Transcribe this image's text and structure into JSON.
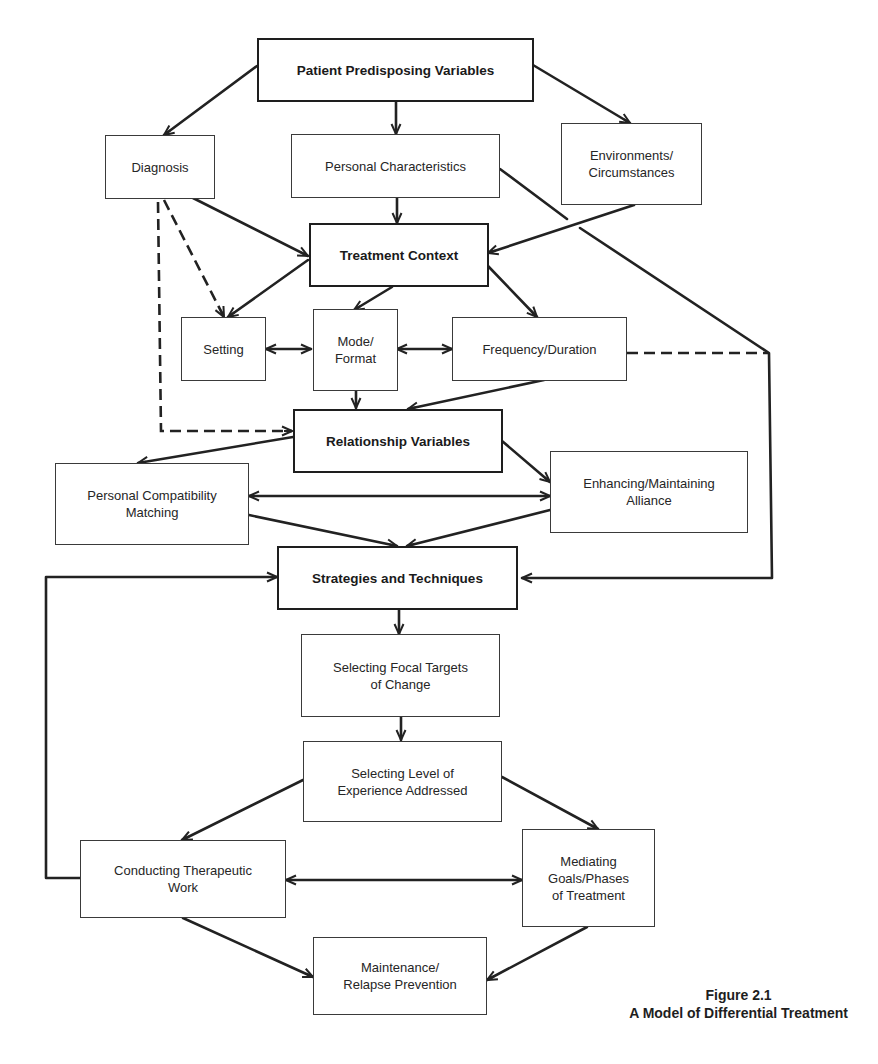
{
  "figure": {
    "number": "Figure 2.1",
    "title": "A Model of Differential Treatment"
  },
  "nodes": {
    "patient_predisposing": {
      "label": "Patient Predisposing Variables",
      "emphasis": "bold"
    },
    "diagnosis": {
      "label": "Diagnosis"
    },
    "personal_characteristics": {
      "label": "Personal Characteristics"
    },
    "environments": {
      "label": "Environments/\nCircumstances"
    },
    "treatment_context": {
      "label": "Treatment Context",
      "emphasis": "bold"
    },
    "setting": {
      "label": "Setting"
    },
    "mode_format": {
      "label": "Mode/\nFormat"
    },
    "frequency_duration": {
      "label": "Frequency/Duration"
    },
    "relationship_variables": {
      "label": "Relationship Variables",
      "emphasis": "bold"
    },
    "personal_compatibility": {
      "label": "Personal Compatibility\nMatching"
    },
    "enhancing_alliance": {
      "label": "Enhancing/Maintaining\nAlliance"
    },
    "strategies_techniques": {
      "label": "Strategies and Techniques",
      "emphasis": "bold"
    },
    "focal_targets": {
      "label": "Selecting Focal Targets\nof Change"
    },
    "level_experience": {
      "label": "Selecting Level of\nExperience Addressed"
    },
    "conducting_work": {
      "label": "Conducting Therapeutic\nWork"
    },
    "mediating_goals": {
      "label": "Mediating\nGoals/Phases\nof Treatment"
    },
    "maintenance": {
      "label": "Maintenance/\nRelapse Prevention"
    }
  },
  "edges": [
    {
      "from": "patient_predisposing",
      "to": "diagnosis",
      "style": "solid"
    },
    {
      "from": "patient_predisposing",
      "to": "personal_characteristics",
      "style": "solid"
    },
    {
      "from": "patient_predisposing",
      "to": "environments",
      "style": "solid"
    },
    {
      "from": "diagnosis",
      "to": "treatment_context",
      "style": "solid"
    },
    {
      "from": "personal_characteristics",
      "to": "treatment_context",
      "style": "solid"
    },
    {
      "from": "environments",
      "to": "treatment_context",
      "style": "solid"
    },
    {
      "from": "personal_characteristics",
      "to": "strategies_techniques",
      "style": "solid"
    },
    {
      "from": "diagnosis",
      "to": "setting",
      "style": "dashed"
    },
    {
      "from": "diagnosis",
      "to": "relationship_variables",
      "style": "dashed"
    },
    {
      "from": "treatment_context",
      "to": "setting",
      "style": "solid"
    },
    {
      "from": "treatment_context",
      "to": "mode_format",
      "style": "solid"
    },
    {
      "from": "treatment_context",
      "to": "frequency_duration",
      "style": "solid"
    },
    {
      "from": "setting",
      "to": "mode_format",
      "style": "solid",
      "bidirectional": true
    },
    {
      "from": "mode_format",
      "to": "frequency_duration",
      "style": "solid",
      "bidirectional": true
    },
    {
      "from": "frequency_duration",
      "to": "strategies_techniques",
      "style": "dashed"
    },
    {
      "from": "mode_format",
      "to": "relationship_variables",
      "style": "solid"
    },
    {
      "from": "frequency_duration",
      "to": "relationship_variables",
      "style": "solid"
    },
    {
      "from": "relationship_variables",
      "to": "personal_compatibility",
      "style": "solid"
    },
    {
      "from": "relationship_variables",
      "to": "enhancing_alliance",
      "style": "solid"
    },
    {
      "from": "personal_compatibility",
      "to": "enhancing_alliance",
      "style": "solid",
      "bidirectional": true
    },
    {
      "from": "personal_compatibility",
      "to": "strategies_techniques",
      "style": "solid"
    },
    {
      "from": "enhancing_alliance",
      "to": "strategies_techniques",
      "style": "solid"
    },
    {
      "from": "strategies_techniques",
      "to": "focal_targets",
      "style": "solid"
    },
    {
      "from": "focal_targets",
      "to": "level_experience",
      "style": "solid"
    },
    {
      "from": "level_experience",
      "to": "conducting_work",
      "style": "solid"
    },
    {
      "from": "level_experience",
      "to": "mediating_goals",
      "style": "solid"
    },
    {
      "from": "conducting_work",
      "to": "mediating_goals",
      "style": "solid",
      "bidirectional": true
    },
    {
      "from": "conducting_work",
      "to": "maintenance",
      "style": "solid"
    },
    {
      "from": "mediating_goals",
      "to": "maintenance",
      "style": "solid"
    },
    {
      "from": "conducting_work",
      "to": "strategies_techniques",
      "style": "solid",
      "feedback": true
    }
  ]
}
